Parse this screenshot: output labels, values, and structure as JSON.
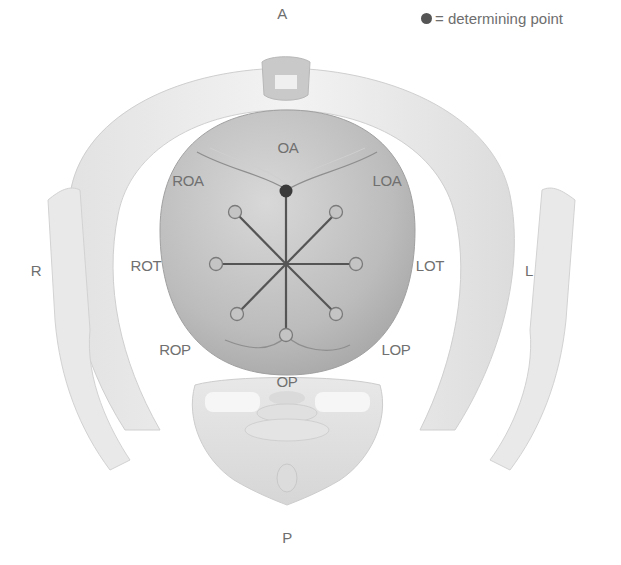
{
  "figure": {
    "orientation_labels": {
      "anterior": "A",
      "posterior": "P",
      "right": "R",
      "left": "L"
    },
    "legend": {
      "symbol": "filled-dot",
      "text": "= determining point"
    },
    "positions": {
      "OA": "OA",
      "LOA": "LOA",
      "LOT": "LOT",
      "LOP": "LOP",
      "OP": "OP",
      "ROP": "ROP",
      "ROT": "ROT",
      "ROA": "ROA"
    },
    "determining_point": "occiput (at OA position)",
    "colors": {
      "label": "#707070",
      "spoke": "#555555",
      "head": "#bdbdbd",
      "pelvis": "#e6e6e6",
      "background": "#ffffff"
    }
  }
}
